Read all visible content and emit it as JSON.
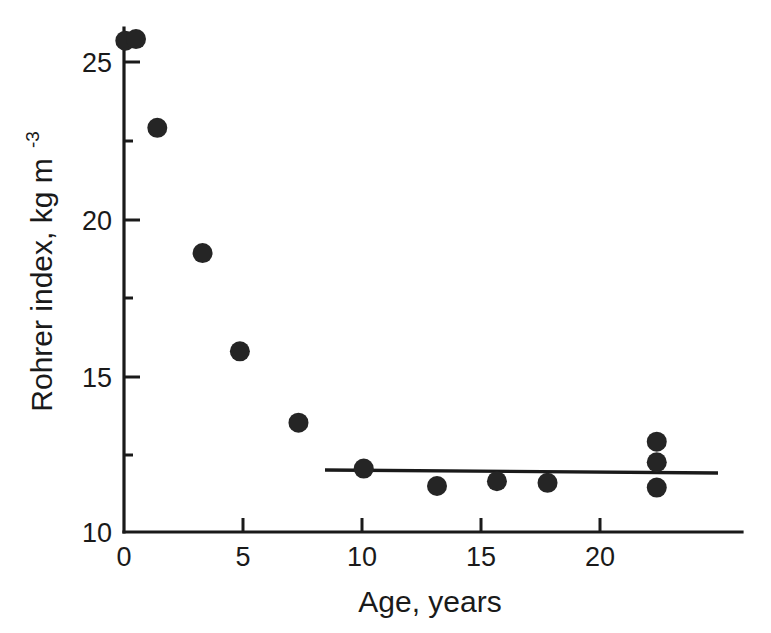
{
  "chart_data": {
    "type": "scatter",
    "title": "",
    "xlabel": "Age, years",
    "ylabel": "Rohrer index, kg m",
    "ylabel_exponent": "-3",
    "ylabel_full": "Rohrer index, kg m-3",
    "xlim": [
      0,
      23.2
    ],
    "ylim": [
      10,
      25.9
    ],
    "xticks": [
      0,
      5,
      10,
      15,
      20
    ],
    "xtick_labels": [
      "0",
      "5",
      "10",
      "15",
      "20"
    ],
    "yticks": [
      10,
      15,
      20,
      25
    ],
    "ytick_labels": [
      "10",
      "15",
      "20",
      "25"
    ],
    "grid": false,
    "legend": null,
    "marker": "filled-circle",
    "marker_color": "#252525",
    "series": [
      {
        "name": "Rohrer index vs age",
        "x": [
          0.05,
          0.45,
          1.25,
          2.95,
          4.35,
          6.55,
          9.0,
          11.75,
          14.0,
          15.9,
          20.0,
          20.0,
          20.0
        ],
        "y": [
          25.5,
          25.55,
          22.75,
          18.8,
          15.7,
          13.45,
          12.0,
          11.45,
          11.6,
          11.55,
          12.85,
          12.2,
          11.4
        ]
      }
    ],
    "annotations": [
      {
        "type": "fit-line",
        "name": "plateau-regression-line",
        "x_start": 8.45,
        "y_start": 11.95,
        "x_end": 23.1,
        "y_end": 11.85
      }
    ]
  },
  "axes": {
    "x_axis_name": "x-axis",
    "y_axis_name": "y-axis"
  }
}
